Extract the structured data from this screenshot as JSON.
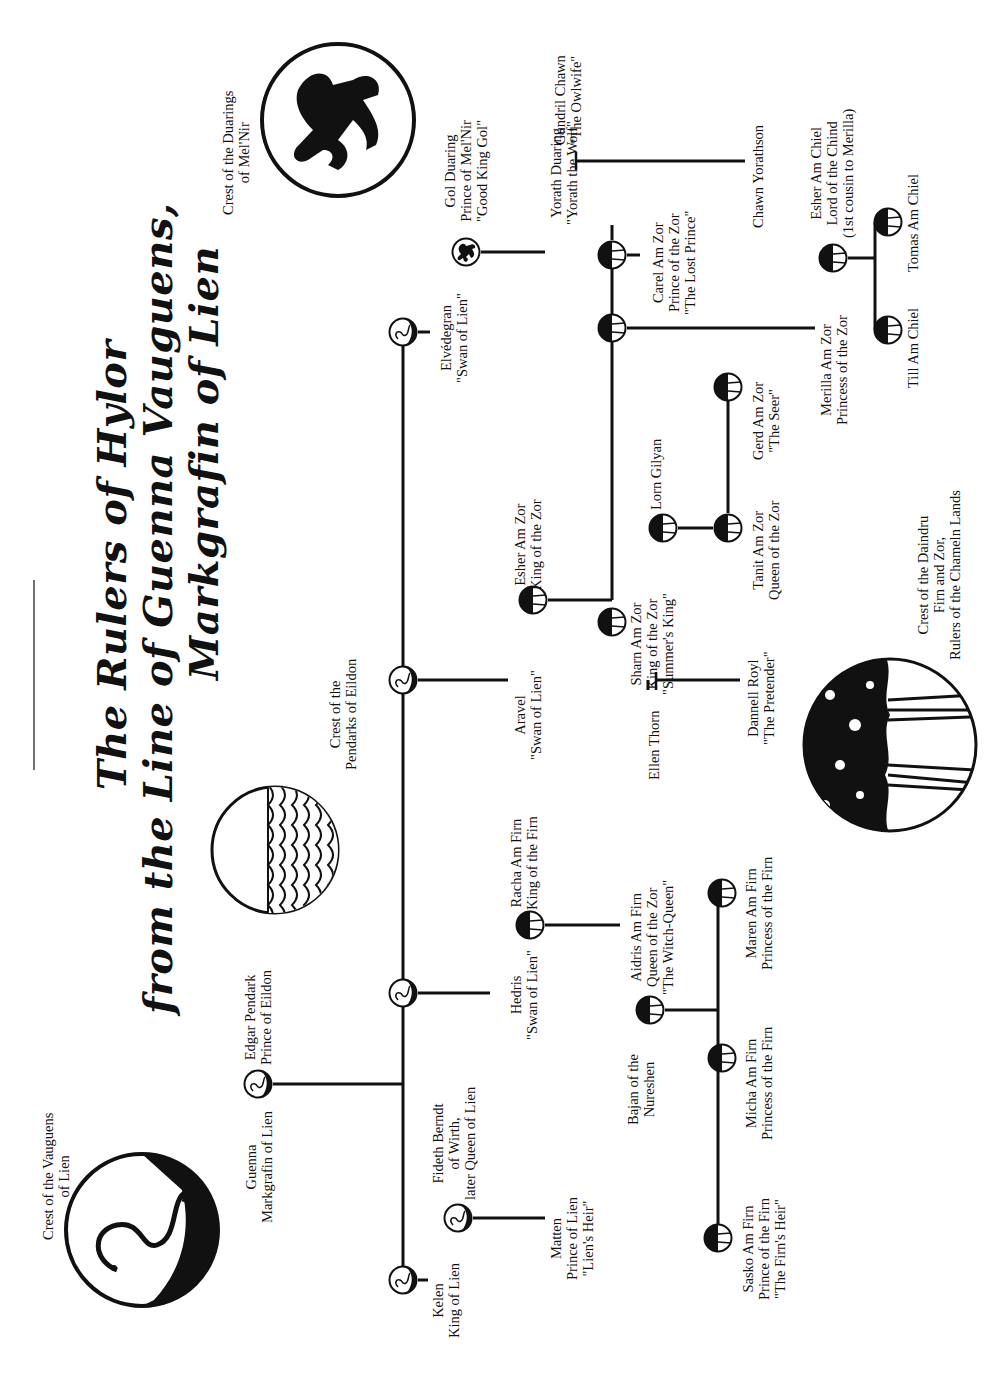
{
  "title": {
    "line1": "The Rulers of Hylor",
    "line2": "from the Line of Guenna Vauguens,",
    "line3": "Markgrafin of Lien"
  },
  "crests": {
    "vauguens": [
      "Crest of the Vauguens",
      "of Lien"
    ],
    "pendarks": [
      "Crest of the",
      "Pendarks of Eildon"
    ],
    "duarings": [
      "Crest of the Duarings",
      "of Mel'Nir"
    ],
    "daindru": [
      "Crest of the Daindru",
      "Firn and Zor,",
      "Rulers of the Chameln Lands"
    ]
  },
  "people": {
    "guenna": [
      "Guenna",
      "Markgrafin of Lien"
    ],
    "edgar": [
      "Edgar Pendark",
      "Prince of Eildon"
    ],
    "kelen": [
      "Kelen",
      "King of Lien"
    ],
    "fideth": [
      "Fideth Berndt",
      "of Wirth,",
      "later Queen of Lien"
    ],
    "matten": [
      "Matten",
      "Prince of Lien",
      "\"Lien's Heir\""
    ],
    "hedris": [
      "Hedris",
      "\"Swan of Lien\""
    ],
    "racha": [
      "Racha Am Firn",
      "King of the Firn"
    ],
    "aidris": [
      "Aidris Am Firn",
      "Queen of the Zor",
      "\"The Witch-Queen\""
    ],
    "bajan": [
      "Bajan of the",
      "Nureshen"
    ],
    "micha": [
      "Micha Am Firn",
      "Princess of the Firn"
    ],
    "maren": [
      "Maren Am Firn",
      "Princess of the Firn"
    ],
    "sasko": [
      "Sasko Am Firn",
      "Prince of the Firn",
      "\"The Firn's Heir\""
    ],
    "aravel": [
      "Aravel",
      "\"Swan of Lien\""
    ],
    "esher_zor": [
      "Esher Am Zor",
      "King of the Zor"
    ],
    "sharn": [
      "Sharn Am Zor",
      "King of the Zor",
      "\"Summer's King\""
    ],
    "ellen": [
      "Ellen Thorn"
    ],
    "dannell": [
      "Dannell Royl",
      "\"The Pretender\""
    ],
    "lorn": [
      "Lorn Gilyan"
    ],
    "tanit": [
      "Tanit Am Zor",
      "Queen of the Zor"
    ],
    "gerd": [
      "Gerd Am Zor",
      "\"The Seer\""
    ],
    "elvedegran": [
      "Elvédegran",
      "\"Swan of Lien\""
    ],
    "gol": [
      "Gol Duaring",
      "Prince of Mel'Nir",
      "\"Good King Gol\""
    ],
    "yorath": [
      "Yorath Duaring",
      "\"Yorath the Wolf\""
    ],
    "gundril": [
      "Gundril Chawn",
      "\"The Owlwife\""
    ],
    "chawn": [
      "Chawn Yorathson"
    ],
    "carel": [
      "Carel Am Zor",
      "Prince of the Zor",
      "\"The Lost Prince\""
    ],
    "merilla": [
      "Merilla Am Zor",
      "Princess of the Zor"
    ],
    "esher_chiel": [
      "Esher Am Chiel",
      "Lord of the Chind",
      "(1st cousin to Merilla)"
    ],
    "till": [
      "Till Am Chiel"
    ],
    "tomas": [
      "Tomas Am Chiel"
    ]
  },
  "colors": {
    "ink": "#111111",
    "paper": "#ffffff"
  }
}
